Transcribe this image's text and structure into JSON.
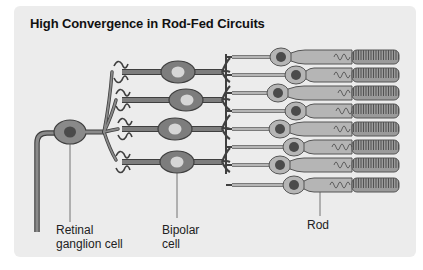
{
  "title": "High Convergence in Rod-Fed Circuits",
  "labels": {
    "ganglion_line1": "Retinal",
    "ganglion_line2": "ganglion cell",
    "bipolar_line1": "Bipolar",
    "bipolar_line2": "cell",
    "rod": "Rod"
  },
  "colors": {
    "panel": "#ececec",
    "cell_fill": "#7d7d7d",
    "cell_outline": "#3f3f3f",
    "nucleus_dark": "#4b4b4b",
    "nucleus_light": "#d6d6d6",
    "rod_fill": "#b5b5b5",
    "rod_outline": "#555555"
  },
  "structure": {
    "ganglion_cells": 1,
    "bipolar_cells": 4,
    "rods": 8
  }
}
